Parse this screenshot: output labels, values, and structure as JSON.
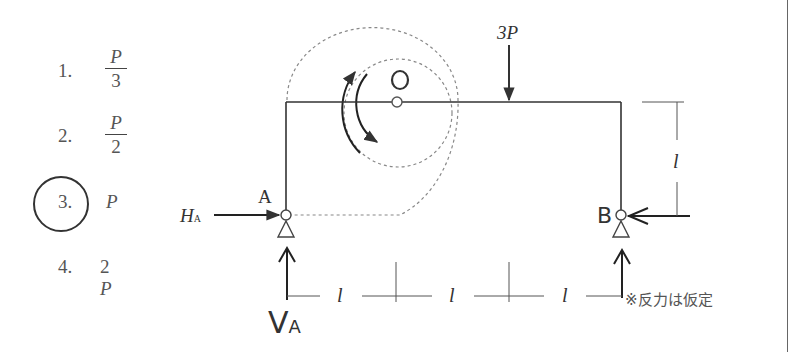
{
  "options": [
    {
      "number": "1.",
      "numerator": "P",
      "denominator": "3",
      "type": "fraction",
      "selected": false
    },
    {
      "number": "2.",
      "numerator": "P",
      "denominator": "2",
      "type": "fraction",
      "selected": false
    },
    {
      "number": "3.",
      "value": "P",
      "type": "plain",
      "selected": true
    },
    {
      "number": "4.",
      "value": "2P",
      "coef": "2",
      "var": "P",
      "type": "plain",
      "selected": false
    }
  ],
  "diagram": {
    "load_label": "3P",
    "hinge_label": "O",
    "support_a_label": "A",
    "support_b_label": "B",
    "reaction_ha_main": "H",
    "reaction_ha_sub": "A",
    "reaction_va_main": "V",
    "reaction_va_sub": "A",
    "height_dim_label": "l",
    "span_dim_labels": [
      "l",
      "l",
      "l"
    ],
    "note": "※反力は仮定"
  },
  "colors": {
    "line": "#333333",
    "text": "#555555",
    "dotted": "#888888",
    "background": "#ffffff"
  }
}
